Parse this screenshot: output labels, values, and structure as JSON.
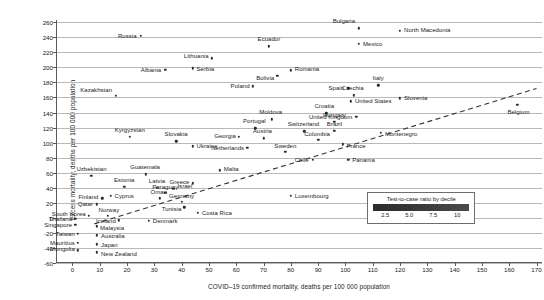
{
  "chart_data": {
    "type": "scatter",
    "title": "",
    "xlabel": "COVID–19 confirmed mortality, deaths per 100 000 population",
    "ylabel": "Excess mortality, deaths per 100 000 population",
    "xlim": [
      -6,
      172
    ],
    "ylim": [
      -60,
      263
    ],
    "xticks": [
      0,
      10,
      20,
      30,
      40,
      50,
      60,
      70,
      80,
      90,
      100,
      110,
      120,
      130,
      140,
      150,
      160,
      170
    ],
    "yticks": [
      -60,
      -40,
      -20,
      0,
      20,
      40,
      60,
      80,
      100,
      120,
      140,
      160,
      180,
      200,
      220,
      240,
      260
    ],
    "grid": "horizontal",
    "legend": {
      "title": "Test-to-case ratio by decile",
      "ticks": [
        "2.5",
        "5.0",
        "7.5",
        "10"
      ],
      "tick_values": [
        2.5,
        5.0,
        7.5,
        10
      ],
      "gradient_from": "#2c2c2c",
      "gradient_to": "#4a4a4a"
    },
    "trend_line": {
      "style": "dashed",
      "x": [
        8,
        170
      ],
      "y": [
        -8,
        172
      ]
    },
    "points": [
      {
        "name": "Bulgaria",
        "x": 105,
        "y": 252,
        "lp": "r",
        "ldx": -4,
        "ldy": -7
      },
      {
        "name": "North Macedonia",
        "x": 120,
        "y": 249,
        "lp": "l",
        "ldx": 4,
        "ldy": -1
      },
      {
        "name": "Russia",
        "x": 25,
        "y": 242,
        "lp": "r",
        "ldx": -4,
        "ldy": 0
      },
      {
        "name": "Ecuador",
        "x": 72,
        "y": 228,
        "lp": "c",
        "ldx": 0,
        "ldy": -7
      },
      {
        "name": "Mexico",
        "x": 105,
        "y": 231,
        "lp": "l",
        "ldx": 4,
        "ldy": 0
      },
      {
        "name": "Lithuania",
        "x": 51,
        "y": 212,
        "lp": "r",
        "ldx": -3,
        "ldy": -2
      },
      {
        "name": "Albania",
        "x": 34,
        "y": 197,
        "lp": "r",
        "ldx": -4,
        "ldy": 0
      },
      {
        "name": "Serbia",
        "x": 44,
        "y": 199,
        "lp": "l",
        "ldx": 4,
        "ldy": 1
      },
      {
        "name": "Romania",
        "x": 80,
        "y": 196,
        "lp": "l",
        "ldx": 4,
        "ldy": -1
      },
      {
        "name": "Bolivia",
        "x": 75,
        "y": 189,
        "lp": "r",
        "ldx": -3,
        "ldy": 2
      },
      {
        "name": "Poland",
        "x": 66,
        "y": 175,
        "lp": "r",
        "ldx": -3,
        "ldy": 0
      },
      {
        "name": "Spain",
        "x": 101,
        "y": 172,
        "lp": "r",
        "ldx": -4,
        "ldy": 0
      },
      {
        "name": "Italy",
        "x": 112,
        "y": 176,
        "lp": "c",
        "ldx": 0,
        "ldy": -7
      },
      {
        "name": "Kazakhstan",
        "x": 16,
        "y": 162,
        "lp": "r",
        "ldx": -4,
        "ldy": -6
      },
      {
        "name": "Czechia",
        "x": 103,
        "y": 163,
        "lp": "c",
        "ldx": -1,
        "ldy": -7
      },
      {
        "name": "Slovenia",
        "x": 120,
        "y": 159,
        "lp": "l",
        "ldx": 4,
        "ldy": 0
      },
      {
        "name": "United States",
        "x": 102,
        "y": 155,
        "lp": "l",
        "ldx": 4,
        "ldy": 0
      },
      {
        "name": "Belgium",
        "x": 163,
        "y": 150,
        "lp": "c",
        "ldx": 1,
        "ldy": 7
      },
      {
        "name": "Croatia",
        "x": 93,
        "y": 139,
        "lp": "c",
        "ldx": -2,
        "ldy": -7
      },
      {
        "name": "United Kingdom",
        "x": 104,
        "y": 134,
        "lp": "r",
        "ldx": -4,
        "ldy": 0
      },
      {
        "name": "Moldova",
        "x": 73,
        "y": 131,
        "lp": "c",
        "ldx": -1,
        "ldy": -7
      },
      {
        "name": "Hungary",
        "x": 96,
        "y": 128,
        "lp": "c",
        "ldx": 0,
        "ldy": -7
      },
      {
        "name": "Kyrgyzstan",
        "x": 21,
        "y": 108,
        "lp": "c",
        "ldx": 0,
        "ldy": -7
      },
      {
        "name": "Portugal",
        "x": 67,
        "y": 119,
        "lp": "c",
        "ldx": -1,
        "ldy": -7
      },
      {
        "name": "Switzerland",
        "x": 85,
        "y": 115,
        "lp": "c",
        "ldx": -1,
        "ldy": -7
      },
      {
        "name": "Brazil",
        "x": 96,
        "y": 116,
        "lp": "c",
        "ldx": 0,
        "ldy": -7
      },
      {
        "name": "Montenegro",
        "x": 113,
        "y": 113,
        "lp": "l",
        "ldx": 4,
        "ldy": 1
      },
      {
        "name": "Slovakia",
        "x": 38,
        "y": 102,
        "lp": "c",
        "ldx": 0,
        "ldy": -7
      },
      {
        "name": "Georgia",
        "x": 61,
        "y": 108,
        "lp": "r",
        "ldx": -3,
        "ldy": -1
      },
      {
        "name": "Austria",
        "x": 70,
        "y": 106,
        "lp": "c",
        "ldx": -1,
        "ldy": -7
      },
      {
        "name": "Colombia",
        "x": 90,
        "y": 104,
        "lp": "c",
        "ldx": -1,
        "ldy": -6
      },
      {
        "name": "France",
        "x": 99,
        "y": 98,
        "lp": "l",
        "ldx": 4,
        "ldy": 2
      },
      {
        "name": "Ukraine",
        "x": 44,
        "y": 95,
        "lp": "l",
        "ldx": 4,
        "ldy": 0
      },
      {
        "name": "Netherlands",
        "x": 64,
        "y": 93,
        "lp": "r",
        "ldx": -3,
        "ldy": 0
      },
      {
        "name": "Sweden",
        "x": 78,
        "y": 88,
        "lp": "c",
        "ldx": 0,
        "ldy": -6
      },
      {
        "name": "Chile",
        "x": 88,
        "y": 77,
        "lp": "r",
        "ldx": -4,
        "ldy": 0
      },
      {
        "name": "Panama",
        "x": 101,
        "y": 77,
        "lp": "l",
        "ldx": 4,
        "ldy": 0
      },
      {
        "name": "Uzbekistan",
        "x": 7,
        "y": 56,
        "lp": "c",
        "ldx": 0,
        "ldy": -7
      },
      {
        "name": "Guatemala",
        "x": 27,
        "y": 58,
        "lp": "c",
        "ldx": -1,
        "ldy": -7
      },
      {
        "name": "Malta",
        "x": 54,
        "y": 63,
        "lp": "l",
        "ldx": 4,
        "ldy": -1
      },
      {
        "name": "Estonia",
        "x": 19,
        "y": 41,
        "lp": "c",
        "ldx": 0,
        "ldy": -7
      },
      {
        "name": "Latvia",
        "x": 31,
        "y": 40,
        "lp": "c",
        "ldx": 0,
        "ldy": -7
      },
      {
        "name": "Israel",
        "x": 37,
        "y": 39,
        "lp": "l",
        "ldx": 4,
        "ldy": -3
      },
      {
        "name": "Greece",
        "x": 44,
        "y": 46,
        "lp": "r",
        "ldx": -3,
        "ldy": -1
      },
      {
        "name": "Paraguay",
        "x": 34,
        "y": 33,
        "lp": "c",
        "ldx": 0,
        "ldy": -6
      },
      {
        "name": "Cyprus",
        "x": 14,
        "y": 29,
        "lp": "l",
        "ldx": 4,
        "ldy": 0
      },
      {
        "name": "Oman",
        "x": 32,
        "y": 26,
        "lp": "c",
        "ldx": -1,
        "ldy": -6
      },
      {
        "name": "Finland",
        "x": 11,
        "y": 26,
        "lp": "r",
        "ldx": -4,
        "ldy": -1
      },
      {
        "name": "Germany",
        "x": 40,
        "y": 21,
        "lp": "c",
        "ldx": 0,
        "ldy": -6
      },
      {
        "name": "Tunisia",
        "x": 41,
        "y": 14,
        "lp": "r",
        "ldx": -3,
        "ldy": 2
      },
      {
        "name": "Qatar",
        "x": 9,
        "y": 18,
        "lp": "r",
        "ldx": -4,
        "ldy": 0
      },
      {
        "name": "Luxembourg",
        "x": 80,
        "y": 29,
        "lp": "l",
        "ldx": 4,
        "ldy": 0
      },
      {
        "name": "Costa Rica",
        "x": 46,
        "y": 7,
        "lp": "l",
        "ldx": 4,
        "ldy": 0
      },
      {
        "name": "Norway",
        "x": 13,
        "y": 3,
        "lp": "c",
        "ldx": 1,
        "ldy": -6
      },
      {
        "name": "South Korea",
        "x": 6,
        "y": 3,
        "lp": "r",
        "ldx": -3,
        "ldy": -2
      },
      {
        "name": "Iceland",
        "x": 17,
        "y": -3,
        "lp": "r",
        "ldx": -3,
        "ldy": 1
      },
      {
        "name": "Thailand",
        "x": 1,
        "y": -1,
        "lp": "r",
        "ldx": -3,
        "ldy": 0
      },
      {
        "name": "Denmark",
        "x": 28,
        "y": -4,
        "lp": "l",
        "ldx": 4,
        "ldy": 0
      },
      {
        "name": "Singapore",
        "x": 1,
        "y": -9,
        "lp": "r",
        "ldx": -3,
        "ldy": 0
      },
      {
        "name": "Malaysia",
        "x": 9,
        "y": -11,
        "lp": "l",
        "ldx": 3,
        "ldy": 2
      },
      {
        "name": "Taiwan",
        "x": 2,
        "y": -21,
        "lp": "r",
        "ldx": -3,
        "ldy": 0
      },
      {
        "name": "Australia",
        "x": 9,
        "y": -23,
        "lp": "l",
        "ldx": 4,
        "ldy": 1
      },
      {
        "name": "Mauritius",
        "x": 2,
        "y": -33,
        "lp": "r",
        "ldx": -3,
        "ldy": 0
      },
      {
        "name": "Japan",
        "x": 9,
        "y": -35,
        "lp": "l",
        "ldx": 4,
        "ldy": 1
      },
      {
        "name": "Mongolia",
        "x": 2,
        "y": -43,
        "lp": "r",
        "ldx": -3,
        "ldy": -1
      },
      {
        "name": "New Zealand",
        "x": 9,
        "y": -46,
        "lp": "l",
        "ldx": 4,
        "ldy": 2
      }
    ]
  }
}
